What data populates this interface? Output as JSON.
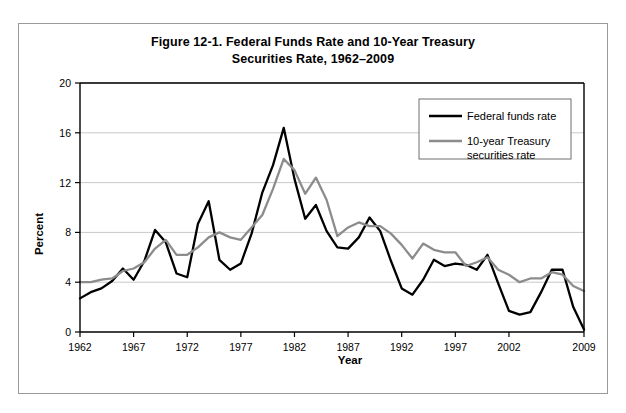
{
  "figure": {
    "title_line_1": "Figure 12-1. Federal Funds Rate and 10-Year Treasury",
    "title_line_2": "Securities Rate, 1962–2009"
  },
  "legend": {
    "position": "inside-top-right",
    "entries": [
      {
        "label": "Federal funds rate",
        "color": "#000000"
      },
      {
        "label_line_1": "10-year Treasury",
        "label_line_2": "securities rate",
        "color": "#8c8c8c"
      }
    ]
  },
  "chart_data": {
    "type": "line",
    "title": "Figure 12-1. Federal Funds Rate and 10-Year Treasury Securities Rate, 1962–2009",
    "xlabel": "Year",
    "ylabel": "Percent",
    "xlim": [
      1962,
      2009
    ],
    "ylim": [
      0,
      20
    ],
    "yticks": [
      0,
      4,
      8,
      12,
      16,
      20
    ],
    "ytick_labels": [
      "0",
      "4",
      "8",
      "12",
      "16",
      "20"
    ],
    "xticks": [
      1962,
      1967,
      1972,
      1977,
      1982,
      1987,
      1992,
      1997,
      2002,
      2009
    ],
    "xtick_labels": [
      "1962",
      "1967",
      "1972",
      "1977",
      "1982",
      "1987",
      "1992",
      "1997",
      "2002",
      "2009"
    ],
    "grid": "horizontal",
    "x": [
      1962,
      1963,
      1964,
      1965,
      1966,
      1967,
      1968,
      1969,
      1970,
      1971,
      1972,
      1973,
      1974,
      1975,
      1976,
      1977,
      1978,
      1979,
      1980,
      1981,
      1982,
      1983,
      1984,
      1985,
      1986,
      1987,
      1988,
      1989,
      1990,
      1991,
      1992,
      1993,
      1994,
      1995,
      1996,
      1997,
      1998,
      1999,
      2000,
      2001,
      2002,
      2003,
      2004,
      2005,
      2006,
      2007,
      2008,
      2009
    ],
    "series": [
      {
        "name": "Federal funds rate",
        "color": "#000000",
        "values": [
          2.7,
          3.2,
          3.5,
          4.1,
          5.1,
          4.2,
          5.7,
          8.2,
          7.2,
          4.7,
          4.4,
          8.7,
          10.5,
          5.8,
          5.0,
          5.5,
          7.9,
          11.2,
          13.4,
          16.4,
          12.3,
          9.1,
          10.2,
          8.1,
          6.8,
          6.7,
          7.6,
          9.2,
          8.1,
          5.7,
          3.5,
          3.0,
          4.2,
          5.8,
          5.3,
          5.5,
          5.4,
          5.0,
          6.2,
          3.9,
          1.7,
          1.4,
          1.6,
          3.2,
          5.0,
          5.0,
          2.0,
          0.2
        ]
      },
      {
        "name": "10-year Treasury securities rate",
        "color": "#8c8c8c",
        "values": [
          4.0,
          4.0,
          4.2,
          4.3,
          4.9,
          5.1,
          5.6,
          6.7,
          7.4,
          6.2,
          6.2,
          6.8,
          7.6,
          8.0,
          7.6,
          7.4,
          8.4,
          9.4,
          11.5,
          13.9,
          13.0,
          11.1,
          12.4,
          10.6,
          7.7,
          8.4,
          8.8,
          8.5,
          8.5,
          7.9,
          7.0,
          5.9,
          7.1,
          6.6,
          6.4,
          6.4,
          5.3,
          5.6,
          6.0,
          5.0,
          4.6,
          4.0,
          4.3,
          4.3,
          4.8,
          4.6,
          3.7,
          3.3
        ]
      }
    ]
  }
}
